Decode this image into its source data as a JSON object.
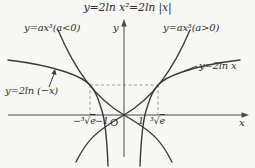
{
  "figure": {
    "title": "y=2ln x²=2ln |x|",
    "curve_labels": {
      "cubic_negative": "y=ax³(a<0)",
      "cubic_positive": "y=ax³(a>0)",
      "log_positive": "y=2ln x",
      "log_negative": "y=2ln (−x)"
    },
    "axes": {
      "x_label": "x",
      "y_label": "y",
      "origin_label": "O"
    },
    "ticks": {
      "neg_cbrt_e": {
        "prefix": "−³√",
        "radicand": "e"
      },
      "neg_one": "−1",
      "one": "1",
      "cbrt_e": {
        "prefix": "³√",
        "radicand": "e"
      }
    },
    "colors": {
      "curve": "#3a3a3a",
      "dashed": "#8f8f8f",
      "background": "#f7f7f4",
      "text": "#2e2e2e"
    }
  }
}
